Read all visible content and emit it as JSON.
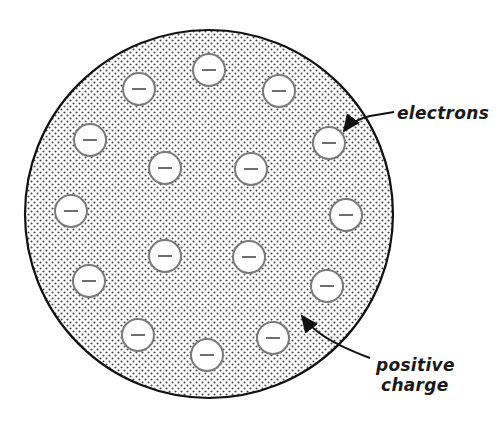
{
  "diagram": {
    "atom": {
      "cx": 209,
      "cy": 214,
      "r": 184
    },
    "electron_radius": 16,
    "electron_symbol": "−",
    "electrons": [
      {
        "x": 139,
        "y": 89
      },
      {
        "x": 209,
        "y": 70
      },
      {
        "x": 279,
        "y": 91
      },
      {
        "x": 90,
        "y": 140
      },
      {
        "x": 329,
        "y": 143
      },
      {
        "x": 165,
        "y": 168
      },
      {
        "x": 251,
        "y": 169
      },
      {
        "x": 71,
        "y": 211
      },
      {
        "x": 346,
        "y": 215
      },
      {
        "x": 165,
        "y": 256
      },
      {
        "x": 249,
        "y": 257
      },
      {
        "x": 89,
        "y": 281
      },
      {
        "x": 327,
        "y": 286
      },
      {
        "x": 138,
        "y": 335
      },
      {
        "x": 273,
        "y": 338
      },
      {
        "x": 207,
        "y": 355
      }
    ],
    "labels": {
      "electrons": "electrons",
      "positive_line1": "positive",
      "positive_line2": "charge"
    },
    "colors": {
      "outline": "#111111",
      "stipple": "#555555",
      "electron_fill": "#ffffff",
      "electron_stroke": "#7a7a7a",
      "minus": "#6e6e6e"
    }
  }
}
